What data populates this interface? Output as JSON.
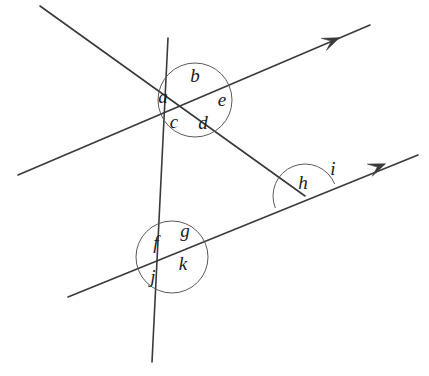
{
  "figure": {
    "background_color": "#ffffff",
    "line_color": "#3a3a3a",
    "arc_color": "#5a5a5a",
    "label_color": "#1a1a1a",
    "line_width": 1.6,
    "arc_width": 1.0,
    "width": 429,
    "height": 376
  },
  "points": {
    "upper_vertex": {
      "name": "upper-intersection",
      "x": 193,
      "y": 100
    },
    "lower_vertex": {
      "name": "lower-intersection",
      "x": 172,
      "y": 257
    },
    "right_vertex": {
      "name": "right-intersection",
      "x": 305,
      "y": 196
    }
  },
  "lines": [
    {
      "id": "line-descending-transversal",
      "name": "descending-transversal",
      "description": "Line falling from upper left through upper vertex down to the right vertex",
      "x1": 40,
      "y1": 6,
      "x2": 305,
      "y2": 196,
      "arrow": "none"
    },
    {
      "id": "line-upper-parallel",
      "name": "upper-parallel-ray",
      "description": "Upper parallel line rising to the right, arrowhead at right end",
      "x1": 18,
      "y1": 175,
      "x2": 370,
      "y2": 25,
      "arrow": "end",
      "arrow_x": 334,
      "arrow_y": 40
    },
    {
      "id": "line-steep-transversal",
      "name": "steep-transversal",
      "description": "Steep near-vertical transversal crossing both parallels",
      "x1": 168,
      "y1": 38,
      "x2": 152,
      "y2": 362,
      "arrow": "none"
    },
    {
      "id": "line-lower-parallel",
      "name": "lower-parallel-ray",
      "description": "Lower parallel line rising to the right, arrowhead at right end",
      "x1": 68,
      "y1": 297,
      "x2": 418,
      "y2": 155,
      "arrow": "end",
      "arrow_x": 380,
      "arrow_y": 166
    }
  ],
  "arcs": [
    {
      "id": "arc-upper",
      "name": "upper-angle-circle",
      "type": "circle",
      "cx": 195,
      "cy": 100,
      "r": 37
    },
    {
      "id": "arc-lower",
      "name": "lower-angle-circle",
      "type": "circle",
      "cx": 172,
      "cy": 257,
      "r": 36
    },
    {
      "id": "arc-right",
      "name": "right-angle-semicircle",
      "type": "semicircle",
      "cx": 305,
      "cy": 196,
      "r": 32,
      "start_angle_deg": 202,
      "end_angle_deg": 22
    }
  ],
  "labels": [
    {
      "id": "label-a",
      "name": "angle-label-a",
      "text": "a",
      "x": 163,
      "y": 99,
      "group": "upper"
    },
    {
      "id": "label-b",
      "name": "angle-label-b",
      "text": "b",
      "x": 195,
      "y": 78,
      "group": "upper"
    },
    {
      "id": "label-c",
      "name": "angle-label-c",
      "text": "c",
      "x": 174,
      "y": 124,
      "group": "upper"
    },
    {
      "id": "label-d",
      "name": "angle-label-d",
      "text": "d",
      "x": 203,
      "y": 125,
      "group": "upper"
    },
    {
      "id": "label-e",
      "name": "angle-label-e",
      "text": "e",
      "x": 222,
      "y": 102,
      "group": "upper"
    },
    {
      "id": "label-f",
      "name": "angle-label-f",
      "text": "f",
      "x": 156,
      "y": 245,
      "group": "lower"
    },
    {
      "id": "label-g",
      "name": "angle-label-g",
      "text": "g",
      "x": 185,
      "y": 233,
      "group": "lower"
    },
    {
      "id": "label-j",
      "name": "angle-label-j",
      "text": "j",
      "x": 153,
      "y": 279,
      "group": "lower"
    },
    {
      "id": "label-k",
      "name": "angle-label-k",
      "text": "k",
      "x": 183,
      "y": 266,
      "group": "lower"
    },
    {
      "id": "label-h",
      "name": "angle-label-h",
      "text": "h",
      "x": 303,
      "y": 185,
      "group": "right"
    },
    {
      "id": "label-i",
      "name": "angle-label-i",
      "text": "i",
      "x": 333,
      "y": 171,
      "group": "right"
    }
  ],
  "label_list": [
    "a",
    "b",
    "c",
    "d",
    "e",
    "f",
    "g",
    "h",
    "i",
    "j",
    "k"
  ]
}
